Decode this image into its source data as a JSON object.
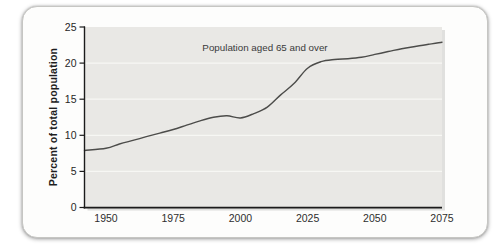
{
  "figure": {
    "annotation": "Population aged 65 and over",
    "y_axis_title": "Percent of total population"
  },
  "chart_data": {
    "type": "line",
    "title": "",
    "annotation": "Population aged 65 and over",
    "xlabel": "",
    "ylabel": "Percent of total population",
    "x_ticks": [
      "1950",
      "1975",
      "2000",
      "2025",
      "2050",
      "2075"
    ],
    "y_ticks": [
      "0",
      "5",
      "10",
      "15",
      "20",
      "25"
    ],
    "xlim": [
      1950,
      2075
    ],
    "ylim": [
      0,
      25
    ],
    "grid": "horizontal-light",
    "legend": "none",
    "line_color": "#4c4c4a",
    "plot_background": "#e9e8e5",
    "y_axis_intercept": 7.9,
    "series": [
      {
        "name": "Population aged 65 and over",
        "x": [
          1950,
          1955,
          1960,
          1965,
          1970,
          1975,
          1980,
          1985,
          1990,
          1995,
          2000,
          2005,
          2010,
          2015,
          2020,
          2025,
          2030,
          2035,
          2040,
          2045,
          2050,
          2055,
          2060,
          2065,
          2070,
          2075
        ],
        "y": [
          8.2,
          8.8,
          9.3,
          9.8,
          10.3,
          10.8,
          11.4,
          12.0,
          12.5,
          12.7,
          12.4,
          13.0,
          13.9,
          15.6,
          17.2,
          19.3,
          20.2,
          20.5,
          20.6,
          20.8,
          21.2,
          21.6,
          22.0,
          22.3,
          22.6,
          22.9
        ]
      }
    ]
  }
}
